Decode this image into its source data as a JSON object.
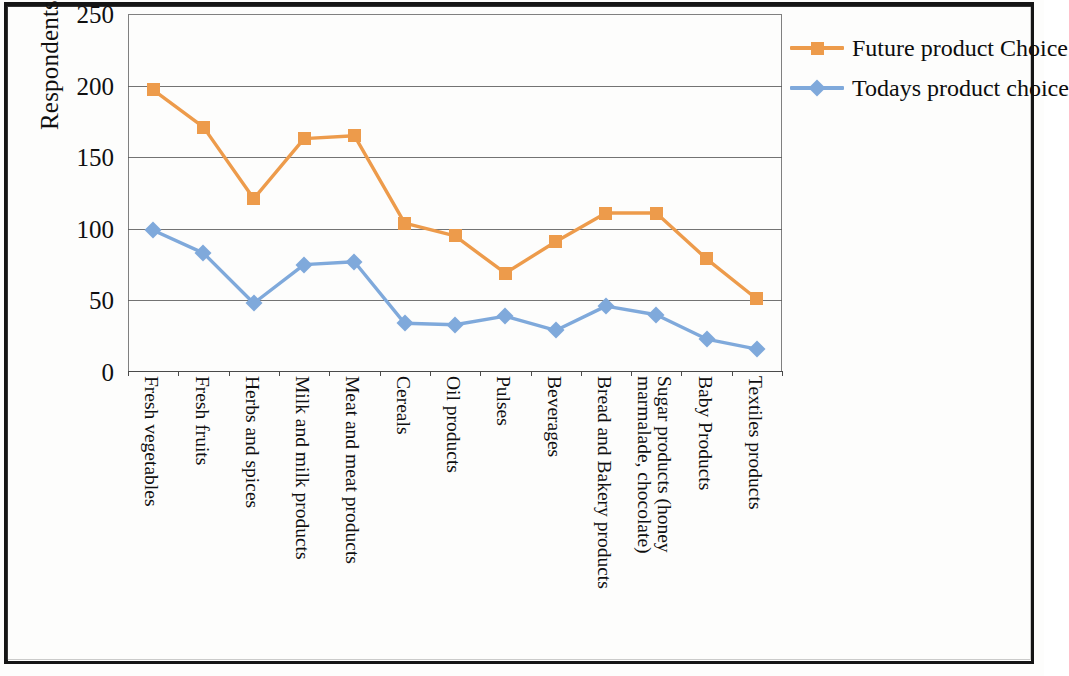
{
  "chart_data": {
    "type": "line",
    "title": "",
    "xlabel": "",
    "ylabel": "Respondents",
    "ylim": [
      0,
      250
    ],
    "ytick_step": 50,
    "yticks": [
      250,
      200,
      150,
      100,
      50,
      0
    ],
    "grid": true,
    "legend_position": "top-right-outside",
    "categories": [
      "Fresh vegetables",
      "Fresh fruits",
      "Herbs and spices",
      "Milk and milk products",
      "Meat and meat products",
      "Cereals",
      "Oil products",
      "Pulses",
      "Beverages",
      "Bread and Bakery products",
      "Sugar products (honey marmalade, chocolate)",
      "Baby Products",
      "Textiles products"
    ],
    "series": [
      {
        "name": "Future product Choice",
        "color": "#ED9B4B",
        "marker": "square",
        "values": [
          197,
          171,
          121,
          163,
          165,
          104,
          95,
          69,
          91,
          111,
          111,
          79,
          51
        ]
      },
      {
        "name": "Todays product choice",
        "color": "#7FA9DB",
        "marker": "diamond",
        "values": [
          99,
          83,
          48,
          75,
          77,
          34,
          33,
          39,
          29,
          46,
          40,
          23,
          16
        ]
      }
    ]
  },
  "legend": {
    "items": [
      {
        "label": "Future product Choice",
        "color": "#ED9B4B"
      },
      {
        "label": "Todays product choice",
        "color": "#7FA9DB"
      }
    ]
  },
  "axes": {
    "y_title": "Respondents"
  }
}
